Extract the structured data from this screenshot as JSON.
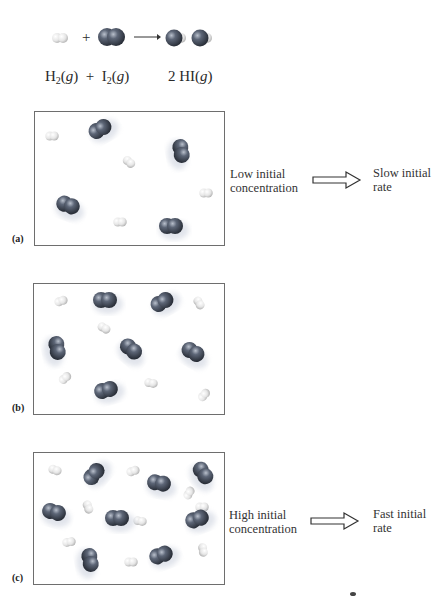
{
  "equation": {
    "reactant1": {
      "symbol": "H",
      "subscript": "2",
      "state": "g"
    },
    "plus": "+",
    "reactant2": {
      "symbol": "I",
      "subscript": "2",
      "state": "g"
    },
    "product": {
      "coefficient": "2",
      "symbol": "HI",
      "state": "g"
    }
  },
  "panels": [
    {
      "label": "(a)",
      "i2_count": 4,
      "h2_count": 4,
      "condition": [
        "Low initial",
        "concentration"
      ],
      "result": [
        "Slow initial",
        "rate"
      ]
    },
    {
      "label": "(b)",
      "i2_count": 6,
      "h2_count": 6,
      "condition": [],
      "result": []
    },
    {
      "label": "(c)",
      "i2_count": 9,
      "h2_count": 9,
      "condition": [
        "High initial",
        "concentration"
      ],
      "result": [
        "Fast initial",
        "rate"
      ]
    }
  ],
  "colors": {
    "iodine": "#4c5566",
    "hydrogen": "#e8e8e8",
    "border": "#6e6e6e"
  }
}
